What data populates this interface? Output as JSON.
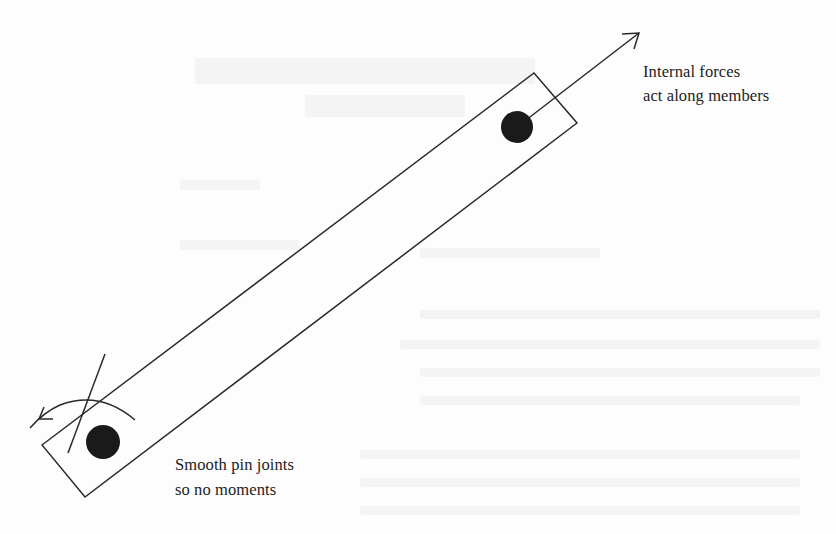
{
  "diagram": {
    "type": "truss-member-free-body",
    "annotations": {
      "internal_forces": {
        "line1": "Internal forces",
        "line2": "act along members"
      },
      "pin_joints": {
        "line1": "Smooth pin joints",
        "line2": "so no moments"
      }
    },
    "elements": {
      "member": {
        "shape": "rectangle",
        "rotation_deg": -36,
        "stroke": "#2a2a2a"
      },
      "upper_joint": {
        "shape": "filled-circle",
        "fill": "#1a1a1a"
      },
      "lower_joint": {
        "shape": "filled-circle",
        "fill": "#1a1a1a"
      },
      "force_arrow": {
        "direction": "along-member-outward",
        "stroke": "#2a2a2a"
      },
      "moment_arrow": {
        "shape": "curved-arrow",
        "crossed_out": true,
        "stroke": "#2a2a2a"
      }
    }
  }
}
